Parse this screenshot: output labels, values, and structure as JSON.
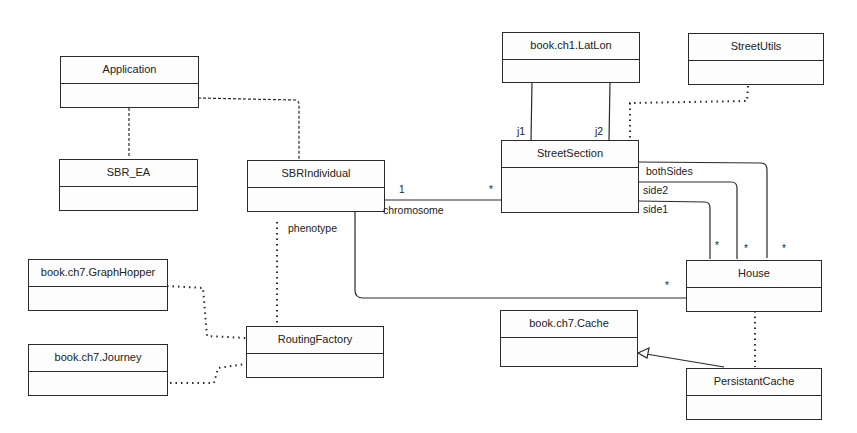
{
  "diagram": {
    "type": "UML class diagram",
    "classes": [
      {
        "id": "application",
        "name": "Application"
      },
      {
        "id": "sbr_ea",
        "name": "SBR_EA"
      },
      {
        "id": "sbrindividual",
        "name": "SBRIndividual"
      },
      {
        "id": "latlon",
        "name": "book.ch1.LatLon"
      },
      {
        "id": "streetutils",
        "name": "StreetUtils"
      },
      {
        "id": "streetsection",
        "name": "StreetSection"
      },
      {
        "id": "graphhopper",
        "name": "book.ch7.GraphHopper"
      },
      {
        "id": "journey",
        "name": "book.ch7.Journey"
      },
      {
        "id": "routingfactory",
        "name": "RoutingFactory"
      },
      {
        "id": "house",
        "name": "House"
      },
      {
        "id": "cache",
        "name": "book.ch7.Cache"
      },
      {
        "id": "persistantcache",
        "name": "PersistantCache"
      }
    ],
    "labels": {
      "chromosome": "chromosome",
      "one": "1",
      "star": "*",
      "phenotype": "phenotype",
      "j1": "j1",
      "j2": "j2",
      "bothSides": "bothSides",
      "side2": "side2",
      "side1": "side1"
    },
    "relationships": [
      {
        "from": "Application",
        "to": "SBR_EA",
        "style": "dashed"
      },
      {
        "from": "Application",
        "to": "SBRIndividual",
        "style": "dashed"
      },
      {
        "from": "SBRIndividual",
        "to": "StreetSection",
        "style": "association",
        "role": "chromosome",
        "multiplicity_from": "1",
        "multiplicity_to": "*"
      },
      {
        "from": "SBRIndividual",
        "to": "RoutingFactory",
        "style": "dotted",
        "role": "phenotype"
      },
      {
        "from": "SBRIndividual",
        "to": "House",
        "style": "association",
        "multiplicity_to": "*"
      },
      {
        "from": "StreetSection",
        "to": "book.ch1.LatLon",
        "style": "association",
        "role": "j1"
      },
      {
        "from": "StreetSection",
        "to": "book.ch1.LatLon",
        "style": "association",
        "role": "j2"
      },
      {
        "from": "StreetSection",
        "to": "StreetUtils",
        "style": "dotted"
      },
      {
        "from": "StreetSection",
        "to": "House",
        "style": "association",
        "role": "bothSides",
        "multiplicity_to": "*"
      },
      {
        "from": "StreetSection",
        "to": "House",
        "style": "association",
        "role": "side2",
        "multiplicity_to": "*"
      },
      {
        "from": "StreetSection",
        "to": "House",
        "style": "association",
        "role": "side1",
        "multiplicity_to": "*"
      },
      {
        "from": "book.ch7.GraphHopper",
        "to": "RoutingFactory",
        "style": "dotted"
      },
      {
        "from": "book.ch7.Journey",
        "to": "RoutingFactory",
        "style": "dotted"
      },
      {
        "from": "House",
        "to": "PersistantCache",
        "style": "dotted"
      },
      {
        "from": "PersistantCache",
        "to": "book.ch7.Cache",
        "style": "generalization"
      }
    ]
  }
}
